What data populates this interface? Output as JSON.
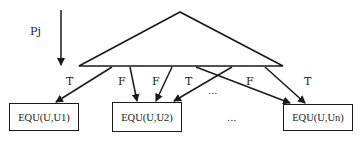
{
  "diagram": {
    "input_label": "Pj",
    "edge_labels": [
      {
        "id": "e1",
        "text": "T"
      },
      {
        "id": "e2",
        "text": "F"
      },
      {
        "id": "e3",
        "text": "F"
      },
      {
        "id": "e4",
        "text": "T"
      },
      {
        "id": "e5",
        "text": "F"
      },
      {
        "id": "e6",
        "text": "T"
      }
    ],
    "nodes": [
      {
        "id": "n1",
        "label": "EQU(U,U1)"
      },
      {
        "id": "n2",
        "label": "EQU(U,U2)"
      },
      {
        "id": "n3",
        "label": "EQU(U,Un)"
      }
    ],
    "ellipsis_middle": "...",
    "ellipsis_bottom": "...",
    "colors": {
      "stroke": "#1a1a1a",
      "background": "#ffffff"
    }
  }
}
